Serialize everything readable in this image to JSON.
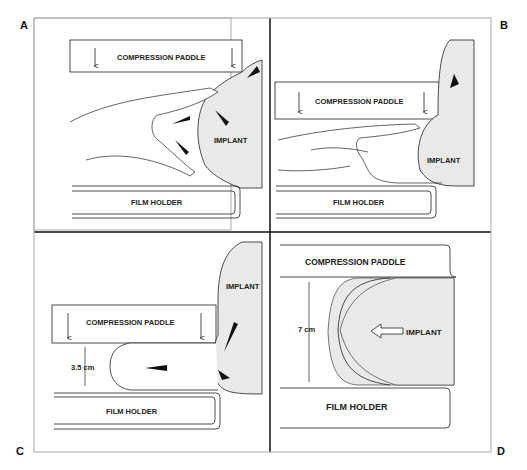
{
  "panels": {
    "A": {
      "letter": "A",
      "paddle": "COMPRESSION PADDLE",
      "implant": "IMPLANT",
      "holder": "FILM HOLDER"
    },
    "B": {
      "letter": "B",
      "paddle": "COMPRESSION PADDLE",
      "implant": "IMPLANT",
      "holder": "FILM HOLDER"
    },
    "C": {
      "letter": "C",
      "paddle": "COMPRESSION PADDLE",
      "implant": "IMPLANT",
      "holder": "FILM HOLDER",
      "measurement": "3.5 cm"
    },
    "D": {
      "letter": "D",
      "paddle": "COMPRESSION PADDLE",
      "implant": "IMPLANT",
      "holder": "FILM HOLDER",
      "measurement": "7 cm"
    }
  },
  "colors": {
    "line": "#1a1a1a",
    "implant_fill": "#e6e6e6",
    "background": "#ffffff"
  }
}
